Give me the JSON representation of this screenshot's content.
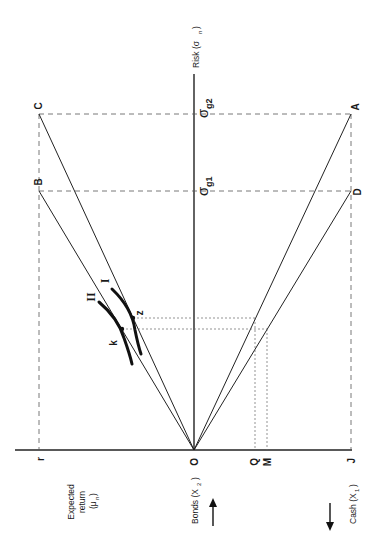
{
  "figure": {
    "orientation": "rotated 90 degrees counter-clockwise",
    "axes": {
      "risk_label": "Risk (σ",
      "risk_sub": "n",
      "risk_close": ")",
      "return_label_line1": "Expected",
      "return_label_line2": "return",
      "return_label_line3": "(μ",
      "return_sub": "n",
      "return_close": ")",
      "bonds_label": "Bonds (X",
      "bonds_sub": "2",
      "bonds_close": ")",
      "cash_label": "Cash (X",
      "cash_sub": "1",
      "cash_close": ")"
    },
    "sigma_levels": {
      "g1_symbol": "σ",
      "g1_sub": "g1",
      "g2_symbol": "σ",
      "g2_sub": "g2"
    },
    "points": {
      "A": "A",
      "B": "B",
      "C": "C",
      "D": "D",
      "O": "O",
      "r": "r",
      "J": "J",
      "Q": "Q",
      "M": "M",
      "k": "k",
      "z": "z"
    },
    "curves": {
      "I": "I",
      "II": "II"
    },
    "colors": {
      "line": "#222222",
      "background": "#ffffff"
    }
  }
}
